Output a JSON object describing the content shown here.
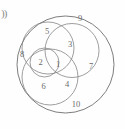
{
  "figure": {
    "corner_mark": "))",
    "type": "venn-diagram",
    "background_color": "#fefefe",
    "stroke_color": "#7d7d7d",
    "label_color": "#6b6b6b"
  },
  "diagram_data": {
    "type": "venn",
    "title": "",
    "set_count": 5,
    "circles": [
      {
        "name": "outer-set",
        "cx": 65.5,
        "cy": 64.5,
        "r": 48.5
      },
      {
        "name": "upper-left-set",
        "cx": 48.0,
        "cy": 48.0,
        "r": 26.0
      },
      {
        "name": "upper-right-set",
        "cx": 72.0,
        "cy": 50.5,
        "r": 27.0
      },
      {
        "name": "lower-left-set",
        "cx": 50.0,
        "cy": 77.0,
        "r": 28.0
      },
      {
        "name": "center-small-set",
        "cx": 44.5,
        "cy": 62.5,
        "r": 14.5
      }
    ],
    "regions": [
      {
        "label": "9",
        "x": 80.0,
        "y": 19.5
      },
      {
        "label": "5",
        "x": 47.0,
        "y": 32.0
      },
      {
        "label": "3",
        "x": 70.0,
        "y": 45.5
      },
      {
        "label": "8",
        "x": 22.0,
        "y": 55.5
      },
      {
        "label": "2",
        "x": 40.5,
        "y": 63.5
      },
      {
        "label": "1",
        "x": 58.0,
        "y": 65.0
      },
      {
        "label": "7",
        "x": 91.0,
        "y": 67.0
      },
      {
        "label": "6",
        "x": 43.5,
        "y": 87.0
      },
      {
        "label": "4",
        "x": 67.0,
        "y": 85.0
      },
      {
        "label": "10",
        "x": 76.0,
        "y": 105.0
      }
    ]
  }
}
